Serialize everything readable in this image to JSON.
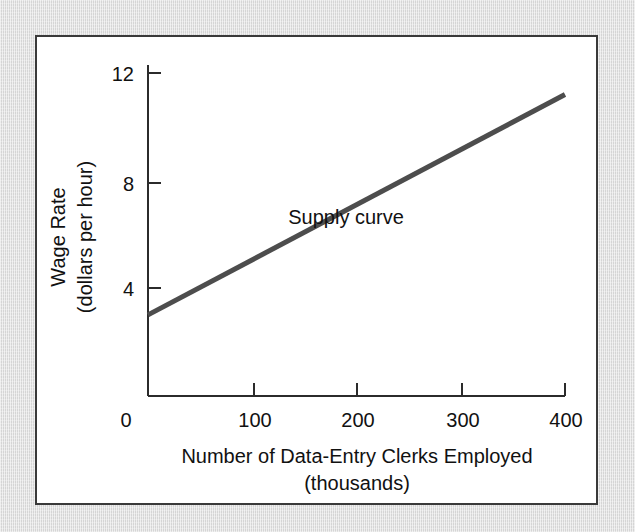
{
  "figure": {
    "background_color": "#dcdcdc",
    "panel_color": "#ffffff",
    "border_color": "#3a3a3a"
  },
  "chart_data": {
    "type": "line",
    "title": "",
    "subtitle": "",
    "xlabel_line1": "Number of Data-Entry Clerks Employed",
    "xlabel_line2": "(thousands)",
    "ylabel_line1": "Wage Rate",
    "ylabel_line2": "(dollars per hour)",
    "xlim": [
      0,
      400
    ],
    "ylim": [
      0,
      12
    ],
    "xticks": [
      0,
      100,
      200,
      300,
      400
    ],
    "xtick_labels": [
      "0",
      "100",
      "200",
      "300",
      "400"
    ],
    "yticks": [
      4,
      8,
      12
    ],
    "ytick_labels": [
      "4",
      "8",
      "12"
    ],
    "grid": false,
    "legend_position": "inline-annotation",
    "series": [
      {
        "name": "Supply curve",
        "color": "#4d4d4d",
        "line_width": 5,
        "x": [
          0,
          400
        ],
        "y": [
          3.0,
          11.2
        ],
        "points": [
          {
            "x": 0,
            "y": 3.0
          },
          {
            "x": 100,
            "y": 5.05
          },
          {
            "x": 200,
            "y": 7.1
          },
          {
            "x": 300,
            "y": 9.15
          },
          {
            "x": 400,
            "y": 11.2
          }
        ]
      }
    ],
    "annotations": [
      {
        "text": "Supply curve",
        "x": 190,
        "y": 6.4
      }
    ]
  }
}
